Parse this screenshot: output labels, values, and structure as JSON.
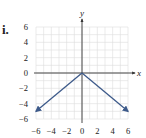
{
  "part_label": "i.",
  "chart_data": {
    "type": "line",
    "title": "",
    "xlabel": "x",
    "ylabel": "y",
    "xlim": [
      -6,
      6
    ],
    "ylim": [
      -6,
      6
    ],
    "grid": true,
    "x_ticks": [
      "-6",
      "-4",
      "-2",
      "0",
      "2",
      "4",
      "6"
    ],
    "y_ticks": [
      "6",
      "4",
      "2",
      "0",
      "-2",
      "-4",
      "-6"
    ],
    "series": [
      {
        "name": "left ray",
        "x": [
          0,
          -6
        ],
        "y": [
          0,
          -5
        ],
        "arrow": true
      },
      {
        "name": "right ray",
        "x": [
          0,
          6
        ],
        "y": [
          0,
          -5
        ],
        "arrow": true
      }
    ],
    "colors": {
      "line": "#3d5a8a",
      "axis": "#333333",
      "grid": "#dddddd"
    }
  }
}
